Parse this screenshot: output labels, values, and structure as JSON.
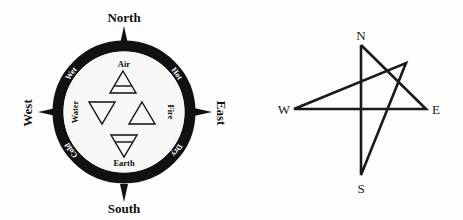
{
  "left_diagram": {
    "directions": {
      "north": "North",
      "south": "South",
      "east": "East",
      "west": "West"
    },
    "qualities": {
      "top_right": "Hot",
      "top_left": "Wet",
      "bottom_left": "Cold",
      "bottom_right": "Dry"
    },
    "elements": {
      "air": "Air",
      "water": "Water",
      "fire": "Fire",
      "earth": "Earth"
    },
    "icons": [
      "air-symbol-icon",
      "water-symbol-icon",
      "fire-symbol-icon",
      "earth-symbol-icon"
    ]
  },
  "right_diagram": {
    "labels": {
      "n": "N",
      "s": "S",
      "e": "E",
      "w": "W"
    }
  }
}
